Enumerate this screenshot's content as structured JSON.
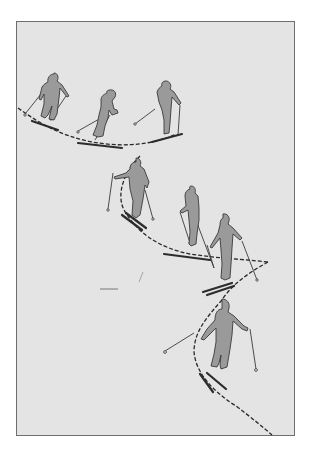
{
  "illustration": {
    "subject": "ski-turn-sequence",
    "frame": {
      "background": "#e4e4e4",
      "border": "#6e6e6e"
    },
    "skier_fill": "#9a9a9a",
    "line_color": "#2c2c2c",
    "skiers": [
      {
        "id": 1,
        "pose": "traverse-upright",
        "x": 49,
        "y": 99
      },
      {
        "id": 2,
        "pose": "crouched-sink",
        "x": 104,
        "y": 113
      },
      {
        "id": 3,
        "pose": "upright-pole-plant",
        "x": 164,
        "y": 107
      },
      {
        "id": 4,
        "pose": "fall-line-turn",
        "x": 133,
        "y": 190
      },
      {
        "id": 5,
        "pose": "traverse-narrow",
        "x": 190,
        "y": 220
      },
      {
        "id": 6,
        "pose": "upright-wide-arms",
        "x": 223,
        "y": 258
      },
      {
        "id": 7,
        "pose": "turn-initiation-pole-plant",
        "x": 220,
        "y": 350
      }
    ],
    "track": "dashed S-curve path"
  }
}
